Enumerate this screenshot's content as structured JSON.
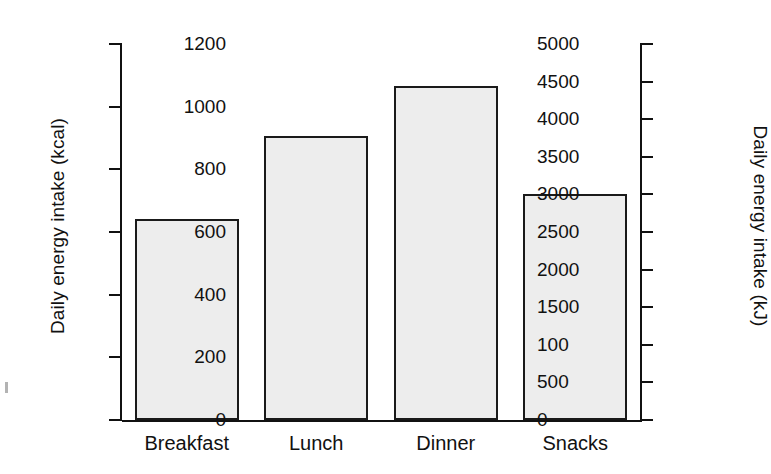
{
  "chart_data": {
    "type": "bar",
    "title": "",
    "categories": [
      "Breakfast",
      "Lunch",
      "Dinner",
      "Snacks"
    ],
    "values": [
      640,
      905,
      1065,
      720
    ],
    "series": [
      {
        "name": "Daily energy intake (kcal)",
        "values": [
          640,
          905,
          1065,
          720
        ]
      }
    ],
    "xlabel": "",
    "ylabel": "Daily energy intake (kcal)",
    "ylabel_right": "Daily energy intake (kJ)",
    "ylim": [
      0,
      1200
    ],
    "ylim_right": [
      0,
      5000
    ],
    "yticks": [
      0,
      200,
      400,
      600,
      800,
      1000,
      1200
    ],
    "ytick_labels": [
      "0",
      "200",
      "400",
      "600",
      "800",
      "1000",
      "1200"
    ],
    "yticks_right": [
      0,
      500,
      1000,
      1500,
      2000,
      2500,
      3000,
      3500,
      4000,
      4500,
      5000
    ],
    "ytick_labels_right": [
      "0",
      "500",
      "100",
      "1500",
      "2000",
      "2500",
      "3000",
      "3500",
      "4000",
      "4500",
      "5000"
    ],
    "grid": false,
    "legend": false,
    "bar_fill_color": "#ededed",
    "bar_edge_color": "#1a1a1a",
    "axis_color": "#111111"
  }
}
